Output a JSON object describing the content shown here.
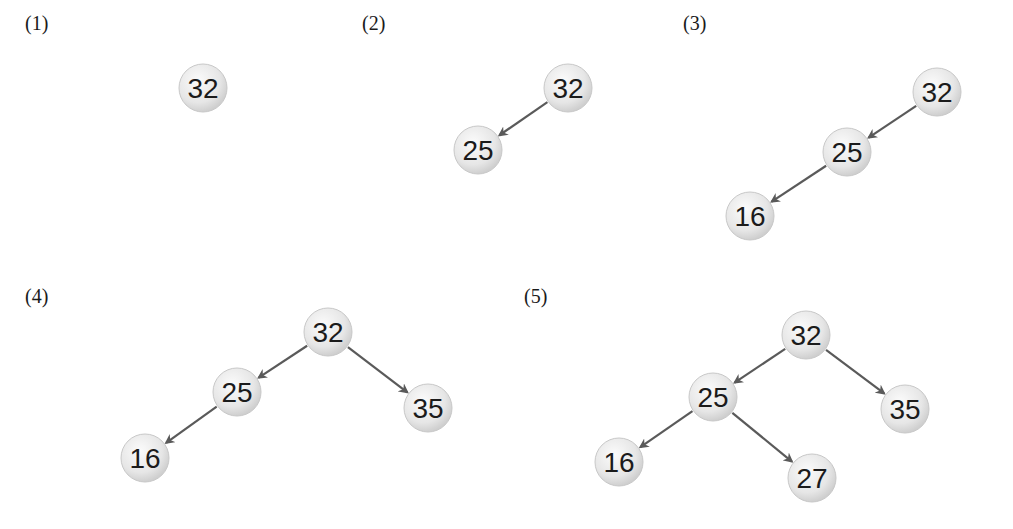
{
  "colors": {
    "edge": "#5a5a5a",
    "node_fill_light": "#f7f7f7",
    "node_fill_dark": "#d2d2d2",
    "node_stroke": "#c8c8c8",
    "text": "#1b1b1b"
  },
  "node_radius": 24,
  "panels": [
    {
      "label": "(1)",
      "label_pos": [
        25,
        12
      ],
      "nodes": [
        {
          "id": "n32",
          "value": "32",
          "x": 203,
          "y": 88
        }
      ],
      "edges": []
    },
    {
      "label": "(2)",
      "label_pos": [
        362,
        12
      ],
      "nodes": [
        {
          "id": "n32",
          "value": "32",
          "x": 568,
          "y": 88
        },
        {
          "id": "n25",
          "value": "25",
          "x": 478,
          "y": 150
        }
      ],
      "edges": [
        {
          "from": "n32",
          "to": "n25"
        }
      ]
    },
    {
      "label": "(3)",
      "label_pos": [
        683,
        12
      ],
      "nodes": [
        {
          "id": "n32",
          "value": "32",
          "x": 937,
          "y": 92
        },
        {
          "id": "n25",
          "value": "25",
          "x": 847,
          "y": 152
        },
        {
          "id": "n16",
          "value": "16",
          "x": 750,
          "y": 216
        }
      ],
      "edges": [
        {
          "from": "n32",
          "to": "n25"
        },
        {
          "from": "n25",
          "to": "n16"
        }
      ]
    },
    {
      "label": "(4)",
      "label_pos": [
        25,
        285
      ],
      "nodes": [
        {
          "id": "n32",
          "value": "32",
          "x": 328,
          "y": 332
        },
        {
          "id": "n25",
          "value": "25",
          "x": 237,
          "y": 392
        },
        {
          "id": "n35",
          "value": "35",
          "x": 428,
          "y": 408
        },
        {
          "id": "n16",
          "value": "16",
          "x": 145,
          "y": 458
        }
      ],
      "edges": [
        {
          "from": "n32",
          "to": "n25"
        },
        {
          "from": "n32",
          "to": "n35"
        },
        {
          "from": "n25",
          "to": "n16"
        }
      ]
    },
    {
      "label": "(5)",
      "label_pos": [
        524,
        285
      ],
      "nodes": [
        {
          "id": "n32",
          "value": "32",
          "x": 806,
          "y": 335
        },
        {
          "id": "n25",
          "value": "25",
          "x": 713,
          "y": 397
        },
        {
          "id": "n35",
          "value": "35",
          "x": 905,
          "y": 409
        },
        {
          "id": "n16",
          "value": "16",
          "x": 619,
          "y": 462
        },
        {
          "id": "n27",
          "value": "27",
          "x": 812,
          "y": 478
        }
      ],
      "edges": [
        {
          "from": "n32",
          "to": "n25"
        },
        {
          "from": "n32",
          "to": "n35"
        },
        {
          "from": "n25",
          "to": "n16"
        },
        {
          "from": "n25",
          "to": "n27"
        }
      ]
    }
  ]
}
